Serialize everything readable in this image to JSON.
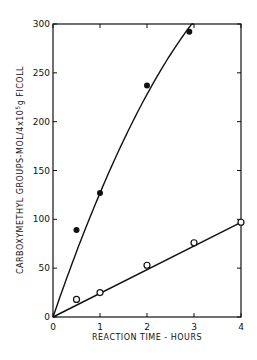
{
  "chart_data": {
    "type": "scatter",
    "title": "",
    "xlabel": "REACTION TIME - HOURS",
    "ylabel": "CARBOXYMETHYL GROUPS-MOL/4x10^5 g FICOLL",
    "xlim": [
      0,
      4
    ],
    "ylim": [
      0,
      300
    ],
    "xticks": [
      "0",
      "1",
      "2",
      "3",
      "4"
    ],
    "yticks": [
      "0",
      "50",
      "100",
      "150",
      "200",
      "250",
      "300"
    ],
    "grid": false,
    "legend": "none",
    "series": [
      {
        "name": "filled circles",
        "marker": "filled-circle",
        "fit": "curve",
        "x": [
          0.5,
          1,
          2,
          2.9
        ],
        "y": [
          89,
          127,
          237,
          292
        ]
      },
      {
        "name": "open circles",
        "marker": "open-circle",
        "fit": "linear",
        "x": [
          0.5,
          1,
          2,
          3,
          4
        ],
        "y": [
          18,
          25,
          53,
          76,
          97
        ]
      }
    ]
  },
  "axes": {
    "xlabel": "REACTION TIME - HOURS",
    "ylabel_main": "CARBOXYMETHYL GROUPS-MOL/4x10",
    "ylabel_sup": "5",
    "ylabel_tail": "g FICOLL",
    "xticks": [
      "0",
      "1",
      "2",
      "3",
      "4"
    ],
    "yticks": [
      "0",
      "50",
      "100",
      "150",
      "200",
      "250",
      "300"
    ]
  }
}
